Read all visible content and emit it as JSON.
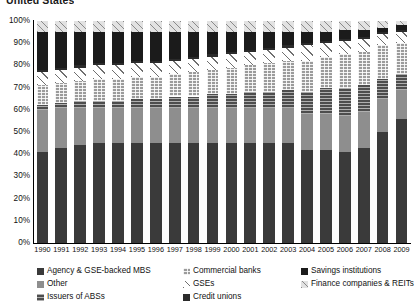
{
  "title": "United States",
  "axis": {
    "y_ticks": [
      "100%",
      "90%",
      "80%",
      "70%",
      "60%",
      "50%",
      "40%",
      "30%",
      "20%",
      "10%",
      "0%"
    ],
    "x_ticks": [
      "1990",
      "1991",
      "1992",
      "1993",
      "1994",
      "1995",
      "1996",
      "1997",
      "1998",
      "1999",
      "2000",
      "2001",
      "2002",
      "2003",
      "2004",
      "2005",
      "2006",
      "2007",
      "2008",
      "2009"
    ]
  },
  "legend": {
    "items": [
      {
        "label": "Agency & GSE-backed MBS",
        "icon": "legend-swatch-solid-darkgray",
        "color": "#3a3a3a",
        "fill": "f-agency",
        "col": 0,
        "row": 0
      },
      {
        "label": "Other",
        "icon": "legend-swatch-solid-gray",
        "color": "#8e8e8e",
        "fill": "f-other",
        "col": 0,
        "row": 1
      },
      {
        "label": "Issuers of ABSs",
        "icon": "legend-swatch-horiz-hatch",
        "color": "#4d4d4d",
        "fill": "f-abs",
        "col": 0,
        "row": 2
      },
      {
        "label": "Commercial banks",
        "icon": "legend-swatch-grid-hatch",
        "color": "#9b9b9b",
        "fill": "f-cbank",
        "col": 1,
        "row": 0
      },
      {
        "label": "GSEs",
        "icon": "legend-swatch-sparse-diag",
        "color": "#6f6f6f",
        "fill": "f-gse",
        "col": 1,
        "row": 1
      },
      {
        "label": "Credit unions",
        "icon": "legend-swatch-solid-black",
        "color": "#2b2b2b",
        "fill": "f-cu",
        "col": 1,
        "row": 2
      },
      {
        "label": "Savings institutions",
        "icon": "legend-swatch-solid-near-black",
        "color": "#1b1b1b",
        "fill": "f-savings",
        "col": 2,
        "row": 0
      },
      {
        "label": "Finance companies & REITs",
        "icon": "legend-swatch-diag-hatch",
        "color": "#8a8a8a",
        "fill": "f-fincorp",
        "col": 2,
        "row": 1
      }
    ]
  },
  "chart_data": {
    "type": "bar",
    "stacked": true,
    "title": "United States",
    "xlabel": "",
    "ylabel": "",
    "ylim": [
      0,
      100
    ],
    "y_unit": "percent",
    "grid": false,
    "legend_position": "bottom",
    "categories": [
      "1990",
      "1991",
      "1992",
      "1993",
      "1994",
      "1995",
      "1996",
      "1997",
      "1998",
      "1999",
      "2000",
      "2001",
      "2002",
      "2003",
      "2004",
      "2005",
      "2006",
      "2007",
      "2008",
      "2009"
    ],
    "series": [
      {
        "name": "Agency & GSE-backed MBS",
        "values": [
          41,
          43,
          44,
          45,
          45,
          45,
          45,
          45,
          45,
          45,
          45,
          45,
          45,
          45,
          42,
          42,
          41,
          43,
          50,
          56
        ]
      },
      {
        "name": "Other",
        "values": [
          19,
          18,
          17,
          16,
          16,
          16,
          16,
          16,
          16,
          16,
          16,
          16,
          16,
          16,
          16,
          16,
          16,
          16,
          15,
          13
        ]
      },
      {
        "name": "Issuers of ABSs",
        "values": [
          2,
          2,
          3,
          3,
          3,
          4,
          4,
          5,
          5,
          6,
          6,
          7,
          7,
          8,
          10,
          12,
          13,
          12,
          9,
          7
        ]
      },
      {
        "name": "Commercial banks",
        "values": [
          9,
          9,
          9,
          10,
          10,
          10,
          10,
          10,
          11,
          11,
          12,
          12,
          13,
          13,
          14,
          14,
          15,
          15,
          15,
          14
        ]
      },
      {
        "name": "GSEs",
        "values": [
          6,
          6,
          6,
          6,
          6,
          6,
          6,
          6,
          6,
          6,
          6,
          6,
          6,
          6,
          7,
          6,
          6,
          6,
          5,
          5
        ]
      },
      {
        "name": "Credit unions",
        "values": [
          1,
          1,
          1,
          1,
          1,
          1,
          1,
          1,
          1,
          1,
          1,
          1,
          1,
          1,
          1,
          1,
          1,
          1,
          1,
          1
        ]
      },
      {
        "name": "Savings institutions",
        "values": [
          17,
          16,
          15,
          14,
          14,
          13,
          13,
          12,
          11,
          10,
          9,
          8,
          7,
          6,
          5,
          4,
          4,
          3,
          2,
          2
        ]
      },
      {
        "name": "Finance companies & REITs",
        "values": [
          5,
          5,
          5,
          5,
          5,
          5,
          5,
          5,
          5,
          5,
          5,
          5,
          5,
          5,
          5,
          5,
          4,
          4,
          3,
          2
        ]
      }
    ]
  }
}
